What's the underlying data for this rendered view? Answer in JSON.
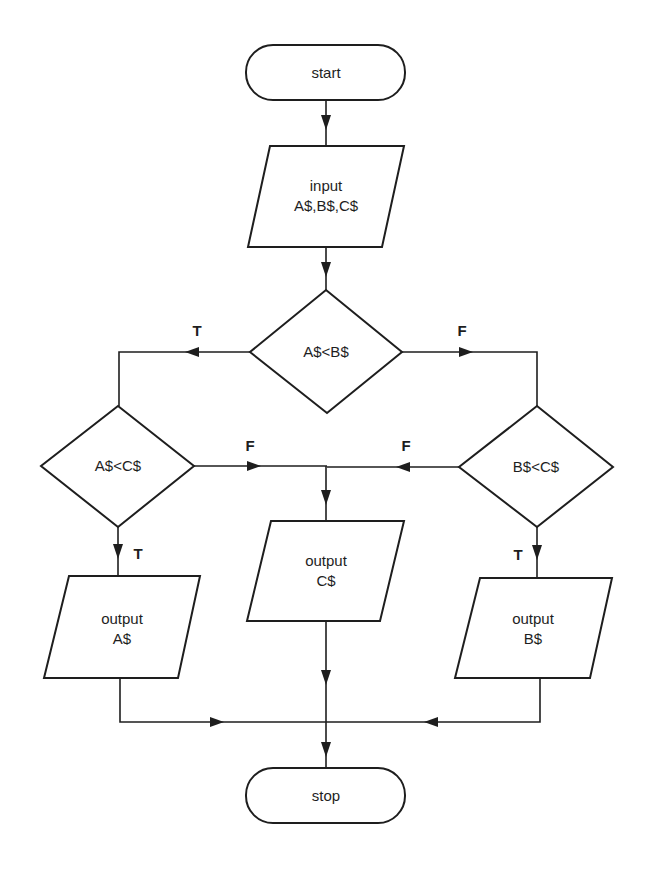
{
  "diagram": {
    "type": "flowchart",
    "nodes": {
      "start": {
        "kind": "terminator",
        "lines": [
          "start"
        ]
      },
      "input": {
        "kind": "io",
        "lines": [
          "input",
          "A$,B$,C$"
        ]
      },
      "cond_ab": {
        "kind": "decision",
        "lines": [
          "A$<B$"
        ]
      },
      "cond_ac": {
        "kind": "decision",
        "lines": [
          "A$<C$"
        ]
      },
      "cond_bc": {
        "kind": "decision",
        "lines": [
          "B$<C$"
        ]
      },
      "out_a": {
        "kind": "io",
        "lines": [
          "output",
          "A$"
        ]
      },
      "out_c": {
        "kind": "io",
        "lines": [
          "output",
          "C$"
        ]
      },
      "out_b": {
        "kind": "io",
        "lines": [
          "output",
          "B$"
        ]
      },
      "stop": {
        "kind": "terminator",
        "lines": [
          "stop"
        ]
      }
    },
    "edge_labels": {
      "ab_true": "T",
      "ab_false": "F",
      "ac_false": "F",
      "ac_true": "T",
      "bc_false": "F",
      "bc_true": "T"
    },
    "edges": [
      {
        "from": "start",
        "to": "input"
      },
      {
        "from": "input",
        "to": "cond_ab"
      },
      {
        "from": "cond_ab",
        "to": "cond_ac",
        "label": "T"
      },
      {
        "from": "cond_ab",
        "to": "cond_bc",
        "label": "F"
      },
      {
        "from": "cond_ac",
        "to": "out_a",
        "label": "T"
      },
      {
        "from": "cond_ac",
        "to": "out_c",
        "label": "F"
      },
      {
        "from": "cond_bc",
        "to": "out_c",
        "label": "F"
      },
      {
        "from": "cond_bc",
        "to": "out_b",
        "label": "T"
      },
      {
        "from": "out_a",
        "to": "stop"
      },
      {
        "from": "out_c",
        "to": "stop"
      },
      {
        "from": "out_b",
        "to": "stop"
      }
    ]
  }
}
